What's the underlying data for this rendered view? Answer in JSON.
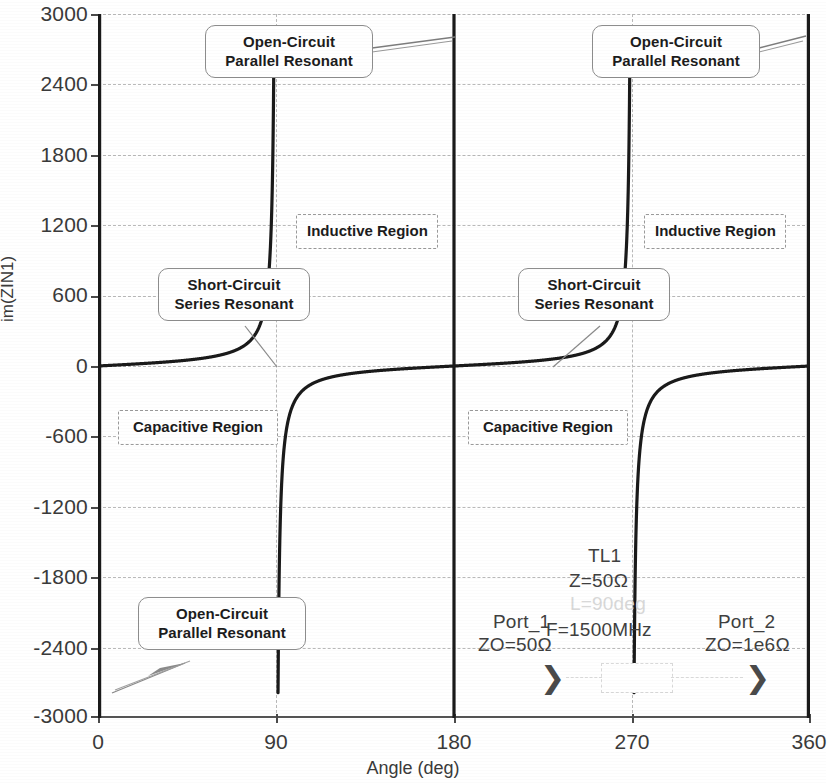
{
  "chart_data": {
    "type": "line",
    "title": "",
    "xlabel": "Angle (deg)",
    "ylabel": "im(ZIN1)",
    "xlim": [
      0,
      360
    ],
    "ylim": [
      -3000,
      3000
    ],
    "xticks": [
      "0",
      "90",
      "180",
      "270",
      "360"
    ],
    "yticks": [
      "3000",
      "2400",
      "1800",
      "1200",
      "600",
      "0",
      "-600",
      "-1200",
      "-1800",
      "-2400",
      "-3000"
    ],
    "grid": true,
    "legend": "none",
    "series": [
      {
        "name": "im(ZIN1)",
        "description": "Z0*tan(theta) for Z0 = 50 ohm open-circuited line; poles at 0, 180 and 360 deg, zeros at 90 and 270 deg",
        "z0": 50,
        "x": [
          0,
          5,
          10,
          20,
          30,
          45,
          60,
          75,
          90,
          105,
          120,
          135,
          150,
          160,
          170,
          175,
          179,
          181,
          185,
          190,
          200,
          210,
          225,
          240,
          255,
          270,
          285,
          300,
          315,
          330,
          340,
          350,
          355,
          359
        ],
        "y": [
          3000,
          571,
          283,
          137,
          86,
          50,
          28,
          13,
          0,
          -13,
          -28,
          -50,
          -86,
          -137,
          -283,
          -571,
          -2865,
          2865,
          571,
          283,
          137,
          86,
          50,
          28,
          13,
          0,
          -13,
          -28,
          -50,
          -86,
          -137,
          -283,
          -571,
          -2865
        ]
      }
    ]
  },
  "axes": {
    "y_title": "im(ZIN1)",
    "x_title": "Angle (deg)",
    "y_ticks": [
      "3000",
      "2400",
      "1800",
      "1200",
      "600",
      "0",
      "-600",
      "-1200",
      "-1800",
      "-2400",
      "-3000"
    ],
    "y_values": [
      3000,
      2400,
      1800,
      1200,
      600,
      0,
      -600,
      -1200,
      -1800,
      -2400,
      -3000
    ],
    "x_ticks": [
      "0",
      "90",
      "180",
      "270",
      "360"
    ],
    "x_values": [
      0,
      90,
      180,
      270,
      360
    ]
  },
  "annotations": [
    {
      "id": "oc-top-left",
      "line1": "Open-Circuit",
      "line2": "Parallel Resonant"
    },
    {
      "id": "oc-top-right",
      "line1": "Open-Circuit",
      "line2": "Parallel Resonant"
    },
    {
      "id": "oc-bottom-left",
      "line1": "Open-Circuit",
      "line2": "Parallel Resonant"
    },
    {
      "id": "sc-left",
      "line1": "Short-Circuit",
      "line2": "Series Resonant"
    },
    {
      "id": "sc-right",
      "line1": "Short-Circuit",
      "line2": "Series Resonant"
    }
  ],
  "regions": [
    {
      "id": "inductive-left",
      "label": "Inductive Region"
    },
    {
      "id": "inductive-right",
      "label": "Inductive Region"
    },
    {
      "id": "capacitive-left",
      "label": "Capacitive Region"
    },
    {
      "id": "capacitive-right",
      "label": "Capacitive Region"
    }
  ],
  "schematic": {
    "tl_name": "TL1",
    "tl_impedance": "Z=50Ω",
    "tl_length": "L=90deg",
    "tl_frequency": "F=1500MHz",
    "port1_name": "Port_1",
    "port1_z": "ZO=50Ω",
    "port2_name": "Port_2",
    "port2_z": "ZO=1e6Ω"
  },
  "colors": {
    "curve": "#1a1a1a",
    "grid": "#b9b9b9",
    "axis": "#555555",
    "text": "#2b2b2b",
    "background": "#ffffff"
  }
}
